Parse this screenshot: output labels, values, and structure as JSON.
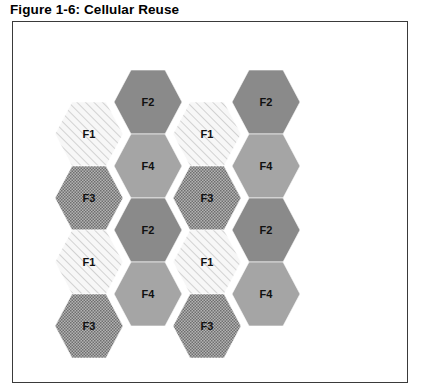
{
  "figure": {
    "title": "Figure 1-6: Cellular Reuse"
  },
  "frame": {
    "border_color": "#3a3a3a",
    "background": "#ffffff"
  },
  "legend_styles": {
    "F1": {
      "name": "diagonal-hatch",
      "base_color": "#f4f4f4",
      "line_color": "#d0d0d0"
    },
    "F2": {
      "name": "solid-dark-gray",
      "base_color": "#8a8a8a"
    },
    "F3": {
      "name": "dotted-checker",
      "base_color": "#9a9a9a",
      "dot_color": "#6e6e6e"
    },
    "F4": {
      "name": "solid-medium-gray",
      "base_color": "#a5a5a5"
    }
  },
  "chart_data": {
    "type": "diagram",
    "title": "Figure 1-6: Cellular Reuse",
    "frequencies": [
      "F1",
      "F2",
      "F3",
      "F4"
    ],
    "columns": 4,
    "cells": [
      {
        "label": "F1",
        "col": 0,
        "row": 0,
        "cx": 76,
        "cy": 112
      },
      {
        "label": "F3",
        "col": 0,
        "row": 1,
        "cx": 76,
        "cy": 176
      },
      {
        "label": "F1",
        "col": 0,
        "row": 2,
        "cx": 76,
        "cy": 240
      },
      {
        "label": "F3",
        "col": 0,
        "row": 3,
        "cx": 76,
        "cy": 304
      },
      {
        "label": "F2",
        "col": 1,
        "row": 0,
        "cx": 135,
        "cy": 80
      },
      {
        "label": "F4",
        "col": 1,
        "row": 1,
        "cx": 135,
        "cy": 144
      },
      {
        "label": "F2",
        "col": 1,
        "row": 2,
        "cx": 135,
        "cy": 208
      },
      {
        "label": "F4",
        "col": 1,
        "row": 3,
        "cx": 135,
        "cy": 272
      },
      {
        "label": "F1",
        "col": 2,
        "row": 0,
        "cx": 194,
        "cy": 112
      },
      {
        "label": "F3",
        "col": 2,
        "row": 1,
        "cx": 194,
        "cy": 176
      },
      {
        "label": "F1",
        "col": 2,
        "row": 2,
        "cx": 194,
        "cy": 240
      },
      {
        "label": "F3",
        "col": 2,
        "row": 3,
        "cx": 194,
        "cy": 304
      },
      {
        "label": "F2",
        "col": 3,
        "row": 0,
        "cx": 253,
        "cy": 80
      },
      {
        "label": "F4",
        "col": 3,
        "row": 1,
        "cx": 253,
        "cy": 144
      },
      {
        "label": "F2",
        "col": 3,
        "row": 2,
        "cx": 253,
        "cy": 208
      },
      {
        "label": "F4",
        "col": 3,
        "row": 3,
        "cx": 253,
        "cy": 272
      }
    ]
  }
}
